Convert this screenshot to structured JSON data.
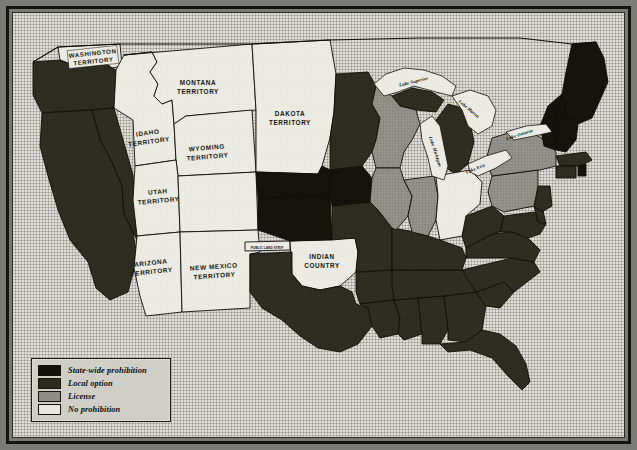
{
  "map": {
    "title": "Prohibition map of the United States",
    "legend": {
      "items": [
        {
          "label": "State-wide prohibition",
          "color": "#13130c",
          "key": "statewide"
        },
        {
          "label": "Local option",
          "color": "#2b2b20",
          "key": "local"
        },
        {
          "label": "License",
          "color": "#8e8e86",
          "key": "license"
        },
        {
          "label": "No prohibition",
          "color": "#e8e8e0",
          "key": "none"
        }
      ]
    },
    "territory_labels": [
      {
        "name": "WASHINGTON TERRITORY",
        "lines": [
          "WASHINGTON",
          "TERRITORY"
        ]
      },
      {
        "name": "MONTANA TERRITORY",
        "lines": [
          "MONTANA",
          "TERRITORY"
        ]
      },
      {
        "name": "IDAHO TERRITORY",
        "lines": [
          "IDAHO",
          "TERRITORY"
        ]
      },
      {
        "name": "WYOMING TERRITORY",
        "lines": [
          "WYOMING",
          "TERRITORY"
        ]
      },
      {
        "name": "DAKOTA TERRITORY",
        "lines": [
          "DAKOTA",
          "TERRITORY"
        ]
      },
      {
        "name": "UTAH TERRITORY",
        "lines": [
          "UTAH",
          "TERRITORY"
        ]
      },
      {
        "name": "ARIZONA TERRITORY",
        "lines": [
          "ARIZONA",
          "TERRITORY"
        ]
      },
      {
        "name": "NEW MEXICO TERRITORY",
        "lines": [
          "NEW MEXICO",
          "TERRITORY"
        ]
      },
      {
        "name": "INDIAN COUNTRY",
        "lines": [
          "INDIAN",
          "COUNTRY"
        ]
      },
      {
        "name": "PUBLIC LAND STRIP",
        "lines": [
          "PUBLIC LAND STRIP"
        ]
      }
    ],
    "lake_labels": [
      {
        "name": "Lake Superior"
      },
      {
        "name": "Lake Michigan"
      },
      {
        "name": "Lake Huron"
      },
      {
        "name": "Lake Erie"
      },
      {
        "name": "Lake Ontario"
      }
    ],
    "labels": {
      "washington_1": "WASHINGTON",
      "washington_2": "TERRITORY",
      "montana_1": "MONTANA",
      "montana_2": "TERRITORY",
      "idaho_1": "IDAHO",
      "idaho_2": "TERRITORY",
      "wyoming_1": "WYOMING",
      "wyoming_2": "TERRITORY",
      "dakota_1": "DAKOTA",
      "dakota_2": "TERRITORY",
      "utah_1": "UTAH",
      "utah_2": "TERRITORY",
      "arizona_1": "ARIZONA",
      "arizona_2": "TERRITORY",
      "newmexico_1": "NEW MEXICO",
      "newmexico_2": "TERRITORY",
      "indian_1": "INDIAN",
      "indian_2": "COUNTRY",
      "public_land_strip": "PUBLIC LAND STRIP",
      "lake_superior": "Lake Superior",
      "lake_michigan": "Lake Michigan",
      "lake_huron": "Lake Huron",
      "lake_erie": "Lake Erie",
      "lake_ontario": "Lake Ontario"
    },
    "state_status": {
      "statewide": [
        "Maine",
        "New Hampshire",
        "Vermont",
        "Kansas",
        "Nebraska",
        "Iowa",
        "Rhode Island"
      ],
      "local": [
        "California",
        "Oregon",
        "Nevada",
        "Texas",
        "Arkansas",
        "Louisiana",
        "Mississippi",
        "Alabama",
        "Georgia",
        "Florida",
        "South Carolina",
        "North Carolina",
        "Tennessee",
        "Kentucky",
        "Virginia",
        "West Virginia",
        "Missouri",
        "Colorado",
        "Minnesota",
        "Michigan",
        "Maryland",
        "Delaware",
        "New Jersey",
        "Massachusetts",
        "Connecticut"
      ],
      "license": [
        "New York",
        "Pennsylvania",
        "Illinois",
        "Indiana",
        "Wisconsin"
      ],
      "none": [
        "Ohio",
        "Montana Territory",
        "Idaho Territory",
        "Wyoming Territory",
        "Dakota Territory",
        "Utah Territory",
        "Arizona Territory",
        "New Mexico Territory",
        "Indian Country",
        "Washington Territory"
      ]
    }
  }
}
